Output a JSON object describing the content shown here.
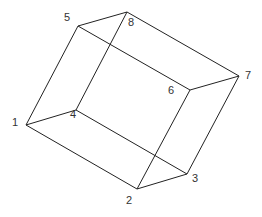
{
  "diagram": {
    "type": "wireframe-parallelepiped",
    "vertices": [
      {
        "id": "1",
        "x": 26,
        "y": 125,
        "label": "1",
        "lx": 12,
        "ly": 123
      },
      {
        "id": "2",
        "x": 137,
        "y": 189,
        "label": "2",
        "lx": 126,
        "ly": 201
      },
      {
        "id": "3",
        "x": 187,
        "y": 174,
        "label": "3",
        "lx": 192,
        "ly": 179
      },
      {
        "id": "4",
        "x": 76,
        "y": 110,
        "label": "4",
        "lx": 70,
        "ly": 115
      },
      {
        "id": "5",
        "x": 78,
        "y": 26,
        "label": "5",
        "lx": 64,
        "ly": 18
      },
      {
        "id": "6",
        "x": 190,
        "y": 90,
        "label": "6",
        "lx": 168,
        "ly": 91
      },
      {
        "id": "7",
        "x": 239,
        "y": 76,
        "label": "7",
        "lx": 245,
        "ly": 76
      },
      {
        "id": "8",
        "x": 127,
        "y": 12,
        "label": "8",
        "lx": 128,
        "ly": 23
      }
    ],
    "edges": [
      [
        "1",
        "5"
      ],
      [
        "5",
        "8"
      ],
      [
        "8",
        "7"
      ],
      [
        "7",
        "6"
      ],
      [
        "6",
        "5"
      ],
      [
        "1",
        "4"
      ],
      [
        "4",
        "8"
      ],
      [
        "4",
        "3"
      ],
      [
        "3",
        "2"
      ],
      [
        "2",
        "1"
      ],
      [
        "2",
        "6"
      ],
      [
        "3",
        "7"
      ]
    ],
    "stroke_color": "#222222",
    "label_color": "#333333"
  }
}
